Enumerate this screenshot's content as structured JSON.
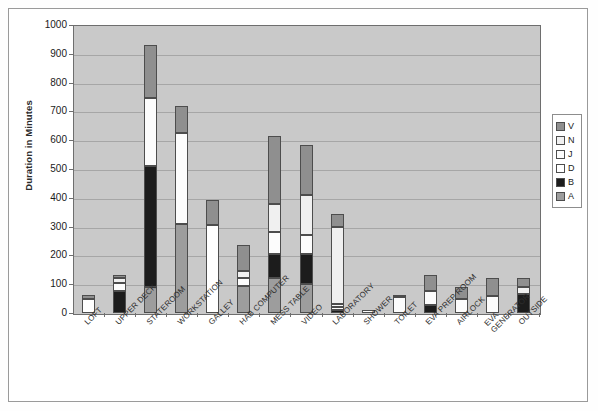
{
  "chart_data": {
    "type": "bar",
    "subtype": "stacked-bar",
    "title": "",
    "xlabel": "",
    "ylabel": "Duration in Minutes",
    "ylim": [
      0,
      1000
    ],
    "ytick_step": 100,
    "yticks": [
      "0",
      "100",
      "200",
      "300",
      "400",
      "500",
      "600",
      "700",
      "800",
      "900",
      "1000"
    ],
    "grid": true,
    "legend_position": "right",
    "plot_background": "#c9c9c9",
    "categories": [
      "LOFT",
      "UPPER DECK",
      "STATEROOM",
      "WORKSTATION",
      "GALLEY",
      "HAB COMPUTER",
      "MESS TABLE",
      "VIDEO",
      "LABORATORY",
      "SHOWER",
      "TOILET",
      "EVA PREP ROOM",
      "AIRLOCK",
      "EVA GENERATOR",
      "OUTSIDE"
    ],
    "series": [
      {
        "name": "A",
        "color": "#9d9d9d",
        "values": [
          0,
          0,
          90,
          310,
          0,
          95,
          120,
          100,
          0,
          0,
          0,
          0,
          0,
          0,
          0
        ]
      },
      {
        "name": "B",
        "color": "#1c1c1c",
        "values": [
          0,
          78,
          420,
          0,
          0,
          0,
          85,
          105,
          12,
          0,
          0,
          28,
          0,
          0,
          65
        ]
      },
      {
        "name": "D",
        "color": "#ffffff",
        "values": [
          50,
          0,
          0,
          0,
          305,
          0,
          0,
          0,
          8,
          0,
          0,
          0,
          0,
          0,
          0
        ]
      },
      {
        "name": "J",
        "color": "#fcfcfc",
        "values": [
          0,
          27,
          235,
          315,
          0,
          28,
          75,
          65,
          10,
          10,
          55,
          50,
          50,
          60,
          0
        ]
      },
      {
        "name": "N",
        "color": "#f0f0f0",
        "values": [
          0,
          17,
          0,
          0,
          0,
          22,
          100,
          140,
          270,
          0,
          0,
          0,
          0,
          0,
          25
        ]
      },
      {
        "name": "V",
        "color": "#8f8f8f",
        "values": [
          12,
          11,
          185,
          93,
          88,
          90,
          235,
          172,
          44,
          0,
          8,
          55,
          40,
          60,
          30
        ]
      }
    ],
    "totals": [
      62,
      133,
      930,
      718,
      393,
      235,
      615,
      582,
      344,
      10,
      63,
      133,
      90,
      120,
      120
    ]
  },
  "legend": {
    "entries": [
      {
        "label": "V",
        "color": "#8f8f8f"
      },
      {
        "label": "N",
        "color": "#f0f0f0"
      },
      {
        "label": "J",
        "color": "#fcfcfc"
      },
      {
        "label": "D",
        "color": "#ffffff"
      },
      {
        "label": "B",
        "color": "#1c1c1c"
      },
      {
        "label": "A",
        "color": "#9d9d9d"
      }
    ]
  }
}
